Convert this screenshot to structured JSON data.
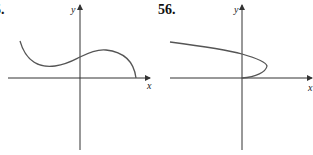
{
  "problems": [
    {
      "number": "5.",
      "axis_labels": {
        "x": "x",
        "y": "y"
      },
      "curve_description": "Curve starting upper-left, dipping to a local minimum left of the y-axis, rising through the y-axis to a local maximum, then descending to meet the x-axis."
    },
    {
      "number": "56.",
      "axis_labels": {
        "x": "x",
        "y": "y"
      },
      "curve_description": "Sideways parabola-like curve opening left, starting upper-left, crossing the y-axis, turning at a vertex to the right, and ending at the origin."
    }
  ],
  "colors": {
    "axes": "#333333",
    "curve": "#555555",
    "text": "#111111"
  }
}
